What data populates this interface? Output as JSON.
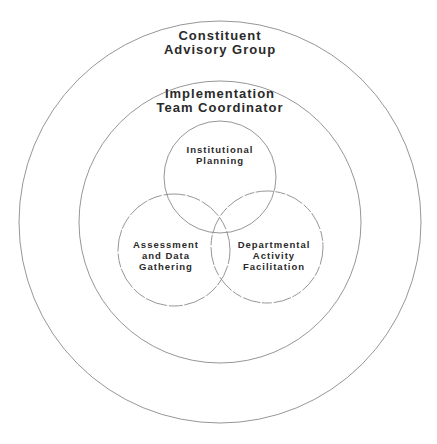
{
  "diagram": {
    "line_color": "#8a8a8a",
    "background": "#ffffff",
    "text_color": "#2a2a2a",
    "rings": [
      {
        "id": "outer",
        "lines": [
          "Constituent",
          "Advisory Group"
        ]
      },
      {
        "id": "middle",
        "lines": [
          "Implementation",
          "Team Coordinator"
        ]
      }
    ],
    "circles": [
      {
        "id": "top",
        "lines": [
          "Institutional",
          "Planning"
        ]
      },
      {
        "id": "left",
        "lines": [
          "Assessment",
          "and Data",
          "Gathering"
        ]
      },
      {
        "id": "right",
        "lines": [
          "Departmental",
          "Activity",
          "Facilitation"
        ]
      }
    ]
  }
}
